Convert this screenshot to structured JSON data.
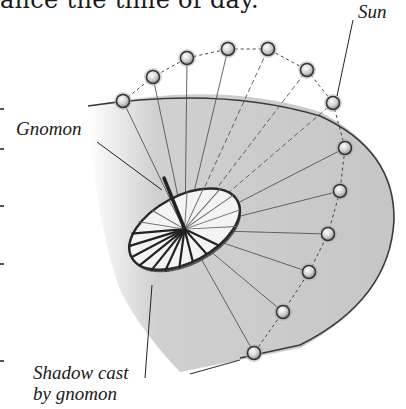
{
  "caption_top": "ance the time of day.",
  "labels": {
    "sun": "Sun",
    "gnomon": "Gnomon",
    "shadow_line1": "Shadow cast",
    "shadow_line2": "by gnomon"
  },
  "colors": {
    "shade": "#c8c8c8",
    "outline": "#3a3a3a",
    "dial_face": "#f4f4f4",
    "sun_fill": "#d9d9d9"
  },
  "sun_positions": [
    [
      123,
      101
    ],
    [
      153,
      77
    ],
    [
      187,
      58
    ],
    [
      228,
      49
    ],
    [
      268,
      49
    ],
    [
      307,
      70
    ],
    [
      333,
      103
    ],
    [
      345,
      148
    ],
    [
      340,
      191
    ],
    [
      328,
      234
    ],
    [
      309,
      272
    ],
    [
      283,
      312
    ],
    [
      254,
      353
    ]
  ],
  "dial_center": [
    185,
    230
  ]
}
